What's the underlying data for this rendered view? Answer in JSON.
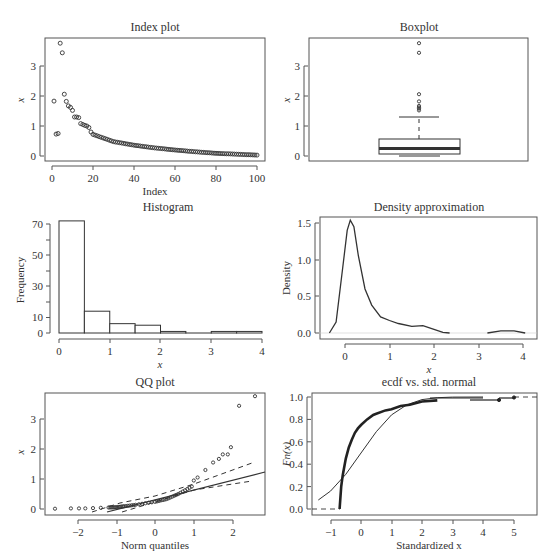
{
  "figure": {
    "panels": [
      {
        "id": "index",
        "title": "Index plot",
        "xlabel": "Index",
        "ylabel": "x"
      },
      {
        "id": "boxplot",
        "title": "Boxplot",
        "xlabel": "",
        "ylabel": "x"
      },
      {
        "id": "histogram",
        "title": "Histogram",
        "xlabel": "x",
        "ylabel": "Frequency"
      },
      {
        "id": "density",
        "title": "Density approximation",
        "xlabel": "x",
        "ylabel": "Density"
      },
      {
        "id": "qq",
        "title": "QQ plot",
        "xlabel": "Norm quantiles",
        "ylabel": "x"
      },
      {
        "id": "ecdf",
        "title": "ecdf vs. std. normal",
        "xlabel": "Standardized x",
        "ylabel": "Fn(x)"
      }
    ],
    "colors": {
      "ink": "#333333",
      "axis": "#555555",
      "background": "#ffffff"
    }
  },
  "chart_data": [
    {
      "type": "scatter",
      "title": "Index plot",
      "xlabel": "Index",
      "ylabel": "x",
      "xlim": [
        0,
        100
      ],
      "ylim": [
        0,
        3.8
      ],
      "xticks": [
        0,
        20,
        40,
        60,
        80,
        100
      ],
      "yticks": [
        0,
        1,
        2,
        3
      ],
      "points_sample": [
        [
          1,
          1.83
        ],
        [
          2,
          0.73
        ],
        [
          3,
          0.75
        ],
        [
          4,
          3.76
        ],
        [
          5,
          3.44
        ],
        [
          6,
          2.06
        ],
        [
          7,
          1.82
        ],
        [
          8,
          1.67
        ],
        [
          9,
          1.62
        ],
        [
          10,
          1.52
        ],
        [
          11,
          1.3
        ],
        [
          12,
          1.3
        ],
        [
          13,
          1.28
        ],
        [
          14,
          1.08
        ],
        [
          15,
          1.05
        ],
        [
          16,
          1.02
        ],
        [
          17,
          1.0
        ],
        [
          18,
          0.95
        ],
        [
          19,
          0.8
        ],
        [
          20,
          0.72
        ],
        [
          25,
          0.6
        ],
        [
          30,
          0.48
        ],
        [
          40,
          0.36
        ],
        [
          50,
          0.27
        ],
        [
          60,
          0.2
        ],
        [
          70,
          0.14
        ],
        [
          80,
          0.09
        ],
        [
          90,
          0.06
        ],
        [
          100,
          0.03
        ]
      ]
    },
    {
      "type": "box",
      "title": "Boxplot",
      "ylabel": "x",
      "ylim": [
        0,
        3.8
      ],
      "yticks": [
        0,
        1,
        2,
        3
      ],
      "whisker_low": 0.0,
      "q1": 0.07,
      "median": 0.24,
      "q3": 0.56,
      "whisker_high": 1.3,
      "outliers": [
        1.52,
        1.58,
        1.62,
        1.67,
        1.82,
        2.06,
        3.44,
        3.76
      ]
    },
    {
      "type": "bar",
      "title": "Histogram",
      "xlabel": "x",
      "ylabel": "Frequency",
      "categories": [
        "0-0.5",
        "0.5-1",
        "1-1.5",
        "1.5-2",
        "2-2.5",
        "2.5-3",
        "3-3.5",
        "3.5-4"
      ],
      "bin_edges": [
        0,
        0.5,
        1,
        1.5,
        2,
        2.5,
        3,
        3.5,
        4
      ],
      "values": [
        72,
        14,
        6,
        5,
        1,
        0,
        1,
        1
      ],
      "xticks": [
        0,
        1,
        2,
        3,
        4
      ],
      "yticks": [
        0,
        10,
        30,
        50,
        70
      ],
      "ylim": [
        0,
        72
      ]
    },
    {
      "type": "line",
      "title": "Density approximation",
      "xlabel": "x",
      "ylabel": "Density",
      "xticks": [
        0,
        1,
        2,
        3,
        4
      ],
      "yticks": [
        0.0,
        0.5,
        1.0,
        1.5
      ],
      "x": [
        -0.35,
        -0.2,
        -0.05,
        0.05,
        0.12,
        0.2,
        0.3,
        0.45,
        0.6,
        0.8,
        1.0,
        1.2,
        1.5,
        1.75,
        2.0,
        2.2,
        2.35,
        3.2,
        3.5,
        3.8,
        4.05
      ],
      "y": [
        0.0,
        0.15,
        0.9,
        1.4,
        1.54,
        1.45,
        1.05,
        0.6,
        0.38,
        0.22,
        0.17,
        0.13,
        0.09,
        0.1,
        0.05,
        0.01,
        0.0,
        0.0,
        0.03,
        0.03,
        0.0
      ]
    },
    {
      "type": "scatter",
      "title": "QQ plot",
      "xlabel": "Norm quantiles",
      "ylabel": "x",
      "xticks": [
        -2,
        -1,
        0,
        1,
        2
      ],
      "yticks": [
        0,
        1,
        2,
        3
      ],
      "points_sample": [
        [
          -2.58,
          0.01
        ],
        [
          -2.17,
          0.02
        ],
        [
          -1.96,
          0.02
        ],
        [
          -1.8,
          0.02
        ],
        [
          -1.6,
          0.03
        ],
        [
          -1.4,
          0.04
        ],
        [
          -1.2,
          0.05
        ],
        [
          -1.0,
          0.06
        ],
        [
          -0.8,
          0.09
        ],
        [
          -0.5,
          0.14
        ],
        [
          0.0,
          0.24
        ],
        [
          0.3,
          0.33
        ],
        [
          0.6,
          0.5
        ],
        [
          0.95,
          0.75
        ],
        [
          1.0,
          0.95
        ],
        [
          1.1,
          1.05
        ],
        [
          1.3,
          1.3
        ],
        [
          1.5,
          1.55
        ],
        [
          1.65,
          1.67
        ],
        [
          1.75,
          1.82
        ],
        [
          1.88,
          1.82
        ],
        [
          1.96,
          2.06
        ],
        [
          2.17,
          3.44
        ],
        [
          2.58,
          3.76
        ]
      ],
      "reference_line": {
        "intercept": 0.36,
        "slope": 0.35
      },
      "envelope_upper": [
        [
          -1.2,
          -0.1
        ],
        [
          0,
          0.42
        ],
        [
          1,
          0.95
        ],
        [
          2.5,
          1.55
        ]
      ],
      "envelope_lower": [
        [
          -0.8,
          -0.1
        ],
        [
          0,
          0.22
        ],
        [
          1,
          0.6
        ],
        [
          2.5,
          0.9
        ]
      ]
    },
    {
      "type": "line",
      "title": "ecdf vs. std. normal",
      "xlabel": "Standardized x",
      "ylabel": "Fn(x)",
      "xticks": [
        -1,
        0,
        1,
        2,
        3,
        4,
        5
      ],
      "yticks": [
        0.0,
        0.2,
        0.4,
        0.6,
        0.8,
        1.0
      ],
      "series": [
        {
          "name": "ecdf",
          "x": [
            -0.7,
            -0.65,
            -0.6,
            -0.5,
            -0.4,
            -0.3,
            -0.2,
            -0.1,
            0.0,
            0.2,
            0.4,
            0.5,
            0.8,
            1.0,
            1.3,
            1.6,
            2.0,
            2.5,
            4.6,
            5.1
          ],
          "y": [
            0.0,
            0.2,
            0.3,
            0.45,
            0.55,
            0.62,
            0.68,
            0.72,
            0.75,
            0.8,
            0.84,
            0.85,
            0.88,
            0.89,
            0.92,
            0.93,
            0.96,
            0.97,
            0.98,
            1.0
          ]
        },
        {
          "name": "std. normal cdf",
          "x": [
            -1.4,
            -1,
            -0.5,
            0,
            0.5,
            1,
            1.5,
            2,
            2.5,
            3,
            4
          ],
          "y": [
            0.08,
            0.16,
            0.31,
            0.5,
            0.69,
            0.84,
            0.93,
            0.977,
            0.994,
            0.999,
            1.0
          ]
        }
      ]
    }
  ]
}
